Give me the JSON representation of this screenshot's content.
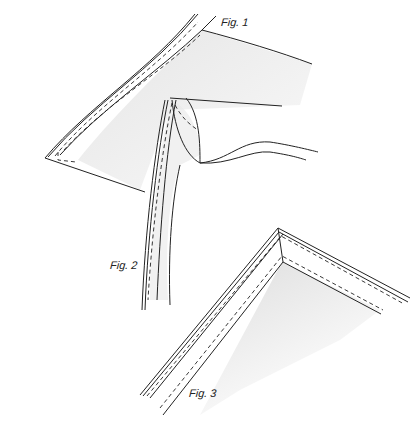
{
  "figures": [
    {
      "id": "fig1",
      "label": "Fig. 1",
      "description": "Fabric corner with stitched binding strip along curved edge"
    },
    {
      "id": "fig2",
      "label": "Fig. 2",
      "description": "Binding strip folded over curved edge of fabric"
    },
    {
      "id": "fig3",
      "label": "Fig. 3",
      "description": "Mitered corner with double stitched binding"
    }
  ],
  "colors": {
    "ink": "#222222",
    "shading": "#d8d8d8",
    "background": "#ffffff"
  }
}
